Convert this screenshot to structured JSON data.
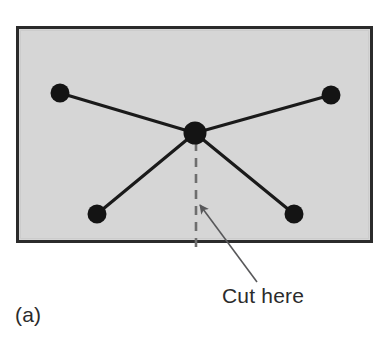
{
  "figure": {
    "panel_label": "(a)",
    "annotation_label": "Cut here",
    "background_color": "#ffffff",
    "panel_fill_color": "#d6d6d6",
    "panel_border_color": "#2b2b2b",
    "node_color": "#141414",
    "edge_color": "#1a1a1a",
    "cut_line_color": "#6e6e6e",
    "leader_color": "#58585a",
    "text_color": "#2b2b2b"
  },
  "diagram": {
    "type": "node-link-graph",
    "panel": {
      "x": 16,
      "y": 26,
      "width": 357,
      "height": 217
    },
    "nodes": [
      {
        "id": "hub",
        "label": "",
        "cx": 195,
        "cy": 133,
        "r": 11.5,
        "role": "center"
      },
      {
        "id": "top-left",
        "label": "",
        "cx": 60,
        "cy": 93,
        "r": 9.5,
        "role": "leaf"
      },
      {
        "id": "top-right",
        "label": "",
        "cx": 331,
        "cy": 95,
        "r": 9.5,
        "role": "leaf"
      },
      {
        "id": "bottom-left",
        "label": "",
        "cx": 97,
        "cy": 214,
        "r": 9.5,
        "role": "leaf"
      },
      {
        "id": "bottom-right",
        "label": "",
        "cx": 294,
        "cy": 214,
        "r": 9.5,
        "role": "leaf"
      }
    ],
    "edges": [
      {
        "from": "top-left",
        "to": "hub"
      },
      {
        "from": "top-right",
        "to": "hub"
      },
      {
        "from": "bottom-left",
        "to": "hub"
      },
      {
        "from": "bottom-right",
        "to": "hub"
      }
    ],
    "cut_line": {
      "x1": 196,
      "y1": 142,
      "x2": 196,
      "y2": 252,
      "style": "dashed"
    },
    "leader": {
      "tip_x": 198,
      "tip_y": 203,
      "end_x": 257,
      "end_y": 282,
      "arrowhead": true
    },
    "annotation_position": {
      "x": 222,
      "y": 303
    },
    "panel_label_position": {
      "x": 15,
      "y": 322
    }
  }
}
